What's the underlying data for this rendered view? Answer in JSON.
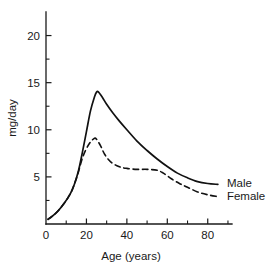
{
  "chart_data": {
    "type": "line",
    "title": "",
    "xlabel": "Age (years)",
    "ylabel": "mg/day",
    "xlim": [
      0,
      92
    ],
    "ylim": [
      0,
      22.5
    ],
    "grid": false,
    "legend_position": "right-inline",
    "xticks": [
      0,
      20,
      40,
      60,
      80
    ],
    "xtick_labels": [
      "0",
      "20",
      "40",
      "60",
      "80"
    ],
    "xminor_ticks": [
      10,
      30,
      50,
      70,
      90
    ],
    "yticks": [
      5,
      10,
      15,
      20
    ],
    "ytick_labels": [
      "5",
      "10",
      "15",
      "20"
    ],
    "yminor_ticks": [
      2.5,
      7.5,
      12.5,
      17.5
    ],
    "series": [
      {
        "name": "Male",
        "style": "solid",
        "color": "#111111",
        "x": [
          1,
          3,
          6,
          9,
          12,
          14,
          16,
          18,
          20,
          22,
          24,
          25,
          26,
          28,
          30,
          33,
          36,
          40,
          45,
          50,
          55,
          60,
          65,
          70,
          75,
          80,
          85
        ],
        "values": [
          0.5,
          0.8,
          1.4,
          2.2,
          3.2,
          4.2,
          5.6,
          7.6,
          9.8,
          12.0,
          13.5,
          14.0,
          14.0,
          13.4,
          12.7,
          11.8,
          11.0,
          10.0,
          8.8,
          7.8,
          6.9,
          6.1,
          5.4,
          4.9,
          4.5,
          4.3,
          4.2
        ]
      },
      {
        "name": "Female",
        "style": "dashed",
        "color": "#111111",
        "x": [
          1,
          3,
          6,
          9,
          12,
          14,
          16,
          18,
          20,
          22,
          24,
          25,
          27,
          29,
          32,
          36,
          40,
          45,
          50,
          55,
          58,
          62,
          66,
          70,
          75,
          80,
          85
        ],
        "values": [
          0.5,
          0.8,
          1.4,
          2.2,
          3.2,
          4.2,
          5.5,
          7.0,
          8.0,
          8.7,
          9.1,
          9.0,
          8.3,
          7.4,
          6.6,
          6.1,
          5.9,
          5.8,
          5.8,
          5.7,
          5.4,
          4.8,
          4.3,
          3.9,
          3.4,
          3.1,
          2.9
        ]
      }
    ],
    "annotations": [
      {
        "text": "Male",
        "x": 88,
        "y": 4.3
      },
      {
        "text": "Female",
        "x": 88,
        "y": 3.0
      }
    ]
  }
}
